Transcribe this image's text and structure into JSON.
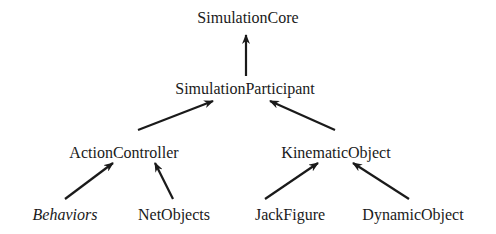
{
  "diagram": {
    "type": "class-hierarchy",
    "nodes": [
      {
        "id": "SimulationCore",
        "label": "SimulationCore",
        "x": 248,
        "y": 10,
        "italic": false
      },
      {
        "id": "SimulationParticipant",
        "label": "SimulationParticipant",
        "x": 245,
        "y": 81,
        "italic": false
      },
      {
        "id": "ActionController",
        "label": "ActionController",
        "x": 124,
        "y": 145,
        "italic": false
      },
      {
        "id": "KinematicObject",
        "label": "KinematicObject",
        "x": 336,
        "y": 145,
        "italic": false
      },
      {
        "id": "Behaviors",
        "label": "Behaviors",
        "x": 65,
        "y": 207,
        "italic": true
      },
      {
        "id": "NetObjects",
        "label": "NetObjects",
        "x": 174,
        "y": 207,
        "italic": false
      },
      {
        "id": "JackFigure",
        "label": "JackFigure",
        "x": 290,
        "y": 207,
        "italic": false
      },
      {
        "id": "DynamicObject",
        "label": "DynamicObject",
        "x": 413,
        "y": 207,
        "italic": false
      }
    ],
    "edges": [
      {
        "from": "SimulationParticipant",
        "to": "SimulationCore",
        "x1": 246,
        "y1": 76,
        "x2": 246,
        "y2": 35
      },
      {
        "from": "ActionController",
        "to": "SimulationParticipant",
        "x1": 138,
        "y1": 130,
        "x2": 213,
        "y2": 101
      },
      {
        "from": "KinematicObject",
        "to": "SimulationParticipant",
        "x1": 335,
        "y1": 130,
        "x2": 270,
        "y2": 101
      },
      {
        "from": "Behaviors",
        "to": "ActionController",
        "x1": 65,
        "y1": 199,
        "x2": 113,
        "y2": 163
      },
      {
        "from": "NetObjects",
        "to": "ActionController",
        "x1": 173,
        "y1": 199,
        "x2": 155,
        "y2": 163
      },
      {
        "from": "JackFigure",
        "to": "KinematicObject",
        "x1": 265,
        "y1": 199,
        "x2": 318,
        "y2": 163
      },
      {
        "from": "DynamicObject",
        "to": "KinematicObject",
        "x1": 409,
        "y1": 199,
        "x2": 353,
        "y2": 163
      }
    ],
    "colors": {
      "line": "#1a1a1a",
      "text": "#1a1a1a",
      "background": "#ffffff"
    }
  }
}
